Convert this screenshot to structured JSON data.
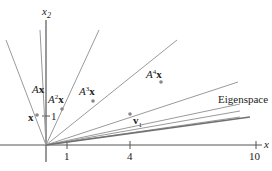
{
  "diagram": {
    "axes": {
      "x_label": "x",
      "x_subscript": "1",
      "y_label": "x",
      "y_subscript": "2",
      "x_ticks": [
        {
          "value": 1,
          "label": "1"
        },
        {
          "value": 4,
          "label": "4"
        },
        {
          "value": 10,
          "label": "10"
        }
      ],
      "y_ticks": [
        {
          "value": 1,
          "label": "1"
        }
      ]
    },
    "vectors": [
      {
        "name": "x",
        "label": "x",
        "power": ""
      },
      {
        "name": "Ax",
        "label": "x",
        "prefix": "A",
        "power": ""
      },
      {
        "name": "A2x",
        "label": "x",
        "prefix": "A",
        "power": "2"
      },
      {
        "name": "A3x",
        "label": "x",
        "prefix": "A",
        "power": "3"
      },
      {
        "name": "A4x",
        "label": "x",
        "prefix": "A",
        "power": "4"
      },
      {
        "name": "v1",
        "label": "v",
        "subscript": "1"
      }
    ],
    "eigenspace_label": "Eigenspace",
    "colors": {
      "line": "#9a9a9a",
      "axis": "#555555",
      "eigenspace": "#707070",
      "point": "#888888",
      "text": "#222222"
    }
  }
}
